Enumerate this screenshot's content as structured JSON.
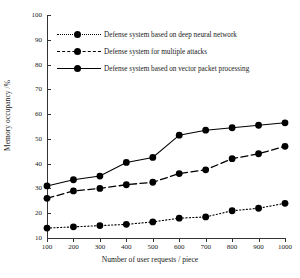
{
  "chart_data": {
    "type": "line",
    "title": "",
    "xlabel": "Number of user requests / piece",
    "ylabel": "Memory occupancy /%",
    "x": [
      100,
      200,
      300,
      400,
      500,
      600,
      700,
      800,
      900,
      1000
    ],
    "categories": [
      "100",
      "200",
      "300",
      "400",
      "500",
      "600",
      "700",
      "800",
      "900",
      "1000"
    ],
    "xtick_labels": [
      "100",
      "200",
      "300",
      "400",
      "500",
      "600",
      "700",
      "800",
      "900",
      "1000"
    ],
    "ytick_labels": [
      "100",
      "90",
      "80",
      "70",
      "60",
      "50",
      "40",
      "30",
      "20",
      "10"
    ],
    "xlim": [
      100,
      1000
    ],
    "ylim": [
      10,
      100
    ],
    "grid": false,
    "legend_position": "upper-left",
    "series": [
      {
        "name": "Defense system based on deep neural network",
        "style": "dotted",
        "marker": "filled-circle",
        "color": "#000000",
        "values": [
          14,
          14.5,
          15,
          15.5,
          16.5,
          18,
          18.5,
          21,
          22,
          24
        ]
      },
      {
        "name": "Defense system for multiple attacks",
        "style": "dashed",
        "marker": "filled-circle",
        "color": "#000000",
        "values": [
          26,
          29,
          30,
          31.5,
          32.5,
          36,
          37.5,
          42,
          44,
          47
        ]
      },
      {
        "name": "Defense system based on vector packet processing",
        "style": "solid",
        "marker": "filled-circle",
        "color": "#000000",
        "values": [
          31,
          33.5,
          35,
          40.5,
          42.5,
          51.5,
          53.5,
          54.5,
          55.5,
          56.5
        ]
      }
    ]
  }
}
